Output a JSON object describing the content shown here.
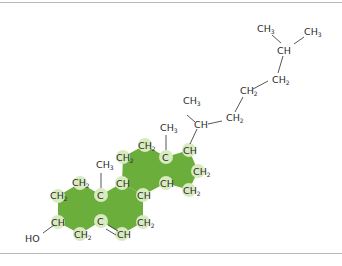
{
  "diagram": {
    "colors": {
      "ring_fill": "#6cae3c",
      "atom_highlight": "#d7ebbf",
      "text": "#2a2a2a",
      "border": "#b9b9b9"
    },
    "labels": {
      "ho": "HO",
      "a1": "CH",
      "a1s": "2",
      "a2": "CH",
      "a2s": "2",
      "a3": "C",
      "a4": "CH3_c",
      "a4t": "CH",
      "a4s": "3",
      "a5": "C",
      "a6": "CH",
      "a6s": "2",
      "a7": "CH",
      "b1": "CH",
      "b2": "CH",
      "b3": "CH",
      "b3s": "2",
      "b4": "CH",
      "c1": "CH",
      "c1s": "2",
      "c2": "CH",
      "c2s": "2",
      "c3": "C",
      "c4": "CH",
      "c4s": "3",
      "c5": "CH",
      "d1": "CH",
      "d2": "CH",
      "d2s": "2",
      "d3": "CH",
      "d3s": "2",
      "s1": "CH",
      "s1m": "CH",
      "s1ms": "3",
      "s2": "CH",
      "s2s": "2",
      "s3": "CH",
      "s3s": "2",
      "s4": "CH",
      "s4s": "2",
      "s5": "CH",
      "s6": "CH",
      "s6s": "3",
      "s7": "CH",
      "s7s": "3"
    }
  }
}
